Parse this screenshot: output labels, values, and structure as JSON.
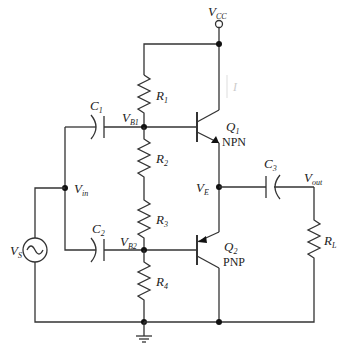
{
  "diagram": {
    "type": "circuit-schematic",
    "labels": {
      "vcc": {
        "main": "V",
        "sub": "CC"
      },
      "ic": {
        "main": "I",
        "sub": "C"
      },
      "r1": {
        "main": "R",
        "sub": "1"
      },
      "r2": {
        "main": "R",
        "sub": "2"
      },
      "r3": {
        "main": "R",
        "sub": "3"
      },
      "r4": {
        "main": "R",
        "sub": "4"
      },
      "rl": {
        "main": "R",
        "sub": "L"
      },
      "c1": {
        "main": "C",
        "sub": "1"
      },
      "c2": {
        "main": "C",
        "sub": "2"
      },
      "c3": {
        "main": "C",
        "sub": "3"
      },
      "vb1": {
        "main": "V",
        "sub": "B1"
      },
      "vb2": {
        "main": "V",
        "sub": "B2"
      },
      "vin": {
        "main": "V",
        "sub": "in"
      },
      "vs": {
        "main": "V",
        "sub": "S"
      },
      "ve": {
        "main": "V",
        "sub": "E"
      },
      "vout": {
        "main": "V",
        "sub": "out"
      },
      "q1": {
        "main": "Q",
        "sub": "1",
        "type": "NPN"
      },
      "q2": {
        "main": "Q",
        "sub": "2",
        "type": "PNP"
      }
    },
    "components": [
      {
        "id": "R1",
        "kind": "resistor"
      },
      {
        "id": "R2",
        "kind": "resistor"
      },
      {
        "id": "R3",
        "kind": "resistor"
      },
      {
        "id": "R4",
        "kind": "resistor"
      },
      {
        "id": "RL",
        "kind": "resistor"
      },
      {
        "id": "C1",
        "kind": "capacitor"
      },
      {
        "id": "C2",
        "kind": "capacitor"
      },
      {
        "id": "C3",
        "kind": "capacitor"
      },
      {
        "id": "Q1",
        "kind": "bjt",
        "polarity": "NPN"
      },
      {
        "id": "Q2",
        "kind": "bjt",
        "polarity": "PNP"
      },
      {
        "id": "VS",
        "kind": "ac-source"
      }
    ],
    "colors": {
      "wire": "#333333",
      "ic_label": "#cccccc"
    }
  }
}
